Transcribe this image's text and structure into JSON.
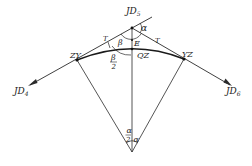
{
  "diagram": {
    "type": "circular-curve-geometry",
    "colors": {
      "line": "#2a2a2a",
      "background": "#ffffff"
    },
    "points": {
      "JD5": {
        "label": "JD",
        "sub": "5"
      },
      "JD4": {
        "label": "JD",
        "sub": "4"
      },
      "JD6": {
        "label": "JD",
        "sub": "6"
      },
      "ZY": {
        "label": "ZY"
      },
      "YZ": {
        "label": "YZ"
      },
      "QZ": {
        "label": "QZ"
      },
      "E": {
        "label": "E"
      }
    },
    "labels": {
      "tangent_left": "T",
      "tangent_right": "T",
      "deflection_angle": "α",
      "beta": "β",
      "beta_half_num": "β",
      "beta_half_den": "2",
      "alpha_half_num": "α",
      "alpha_half_den": "2",
      "center_angle": "α"
    }
  }
}
